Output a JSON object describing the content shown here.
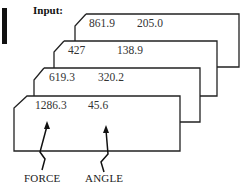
{
  "title_label": "Input:",
  "cards": [
    {
      "force": "861.9",
      "angle": "205.0"
    },
    {
      "force": "427",
      "angle": "138.9"
    },
    {
      "force": "619.3",
      "angle": "320.2"
    },
    {
      "force": "1286.3",
      "angle": "45.6"
    }
  ],
  "labels": {
    "force": "FORCE",
    "angle": "ANGLE"
  },
  "colors": {
    "line": "#222222",
    "background": "#ffffff"
  }
}
